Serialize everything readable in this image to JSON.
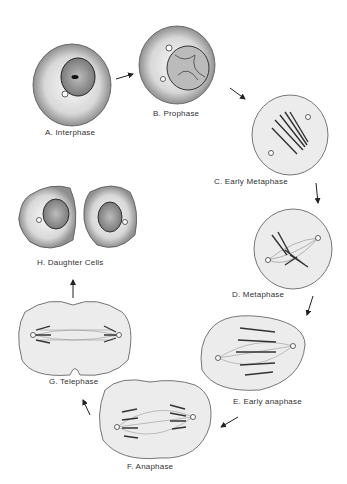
{
  "diagram": {
    "stages": [
      {
        "id": "A",
        "label": "A.  Interphase"
      },
      {
        "id": "B",
        "label": "B.  Prophase"
      },
      {
        "id": "C",
        "label": "C.  Early Metaphase"
      },
      {
        "id": "D",
        "label": "D.  Metaphase"
      },
      {
        "id": "E",
        "label": "E.  Early anaphase"
      },
      {
        "id": "F",
        "label": "F.  Anaphase"
      },
      {
        "id": "G",
        "label": "G.  Telephase"
      },
      {
        "id": "H",
        "label": "H.  Daughter Cells"
      }
    ],
    "colors": {
      "outline": "#333333",
      "shade": "#9a9a9a",
      "fill": "#e8e8e8",
      "text": "#333333"
    }
  }
}
